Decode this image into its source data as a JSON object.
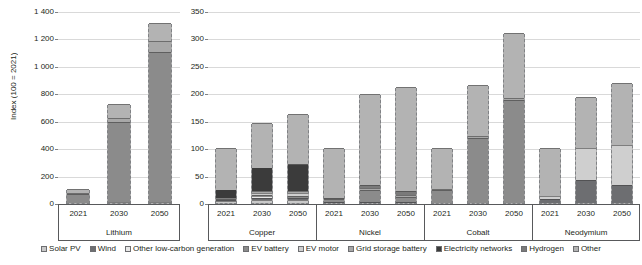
{
  "chart_data": {
    "type": "bar",
    "subtype": "stacked-bar",
    "title": "",
    "ylabel": "Index (100 = 2021)",
    "xlabel": "",
    "grid": true,
    "legend_position": "bottom",
    "panels": [
      {
        "name": "left-panel",
        "ylim": [
          0,
          1400
        ],
        "yticks": [
          0,
          200,
          400,
          600,
          800,
          1000,
          1200,
          1400
        ],
        "ytick_labels": [
          "0",
          "200",
          "400",
          "600",
          "800",
          "1 000",
          "1 200",
          "1 400"
        ],
        "groups": [
          {
            "group": "Lithium",
            "categories": [
              "2021",
              "2030",
              "2050"
            ],
            "series": [
              {
                "name": "Solar PV",
                "values": [
                  2,
                  4,
                  5
                ]
              },
              {
                "name": "Wind",
                "values": [
                  1,
                  2,
                  3
                ]
              },
              {
                "name": "Other low-carbon generation",
                "values": [
                  0,
                  0,
                  0
                ]
              },
              {
                "name": "EV battery",
                "values": [
                  62,
                  588,
                  1090
                ]
              },
              {
                "name": "EV motor",
                "values": [
                  0,
                  0,
                  0
                ]
              },
              {
                "name": "Grid storage battery",
                "values": [
                  5,
                  25,
                  85
                ]
              },
              {
                "name": "Electricity networks",
                "values": [
                  0,
                  0,
                  0
                ]
              },
              {
                "name": "Hydrogen",
                "values": [
                  0,
                  0,
                  0
                ]
              },
              {
                "name": "Other",
                "values": [
                  30,
                  101,
                  127
                ]
              }
            ],
            "totals": [
              100,
              720,
              1310
            ]
          }
        ]
      },
      {
        "name": "right-panel",
        "ylim": [
          0,
          350
        ],
        "yticks": [
          0,
          50,
          100,
          150,
          200,
          250,
          300,
          350
        ],
        "ytick_labels": [
          "0",
          "50",
          "100",
          "150",
          "200",
          "250",
          "300",
          "350"
        ],
        "groups": [
          {
            "group": "Copper",
            "categories": [
              "2021",
              "2030",
              "2050"
            ],
            "series": [
              {
                "name": "Solar PV",
                "values": [
                  3,
                  6,
                  5
                ]
              },
              {
                "name": "Wind",
                "values": [
                  2,
                  4,
                  4
                ]
              },
              {
                "name": "Other low-carbon generation",
                "values": [
                  1,
                  2,
                  2
                ]
              },
              {
                "name": "EV battery",
                "values": [
                  1,
                  2,
                  2
                ]
              },
              {
                "name": "EV motor",
                "values": [
                  2,
                  5,
                  6
                ]
              },
              {
                "name": "Grid storage battery",
                "values": [
                  1,
                  2,
                  3
                ]
              },
              {
                "name": "Electricity networks",
                "values": [
                  13,
                  42,
                  48
                ]
              },
              {
                "name": "Hydrogen",
                "values": [
                  0,
                  1,
                  1
                ]
              },
              {
                "name": "Other",
                "values": [
                  77,
                  81,
                  91
                ]
              }
            ],
            "totals": [
              100,
              145,
              162
            ]
          },
          {
            "group": "Nickel",
            "categories": [
              "2021",
              "2030",
              "2050"
            ],
            "series": [
              {
                "name": "Solar PV",
                "values": [
                  0,
                  0,
                  0
                ]
              },
              {
                "name": "Wind",
                "values": [
                  1,
                  2,
                  2
                ]
              },
              {
                "name": "Other low-carbon generation",
                "values": [
                  1,
                  2,
                  2
                ]
              },
              {
                "name": "EV battery",
                "values": [
                  5,
                  19,
                  7
                ]
              },
              {
                "name": "EV motor",
                "values": [
                  0,
                  0,
                  0
                ]
              },
              {
                "name": "Grid storage battery",
                "values": [
                  1,
                  5,
                  4
                ]
              },
              {
                "name": "Electricity networks",
                "values": [
                  0,
                  0,
                  0
                ]
              },
              {
                "name": "Hydrogen",
                "values": [
                  1,
                  4,
                  6
                ]
              },
              {
                "name": "Other",
                "values": [
                  91,
                  166,
                  191
                ]
              }
            ],
            "totals": [
              100,
              198,
              212
            ]
          },
          {
            "group": "Cobalt",
            "categories": [
              "2021",
              "2030",
              "2050"
            ],
            "series": [
              {
                "name": "Solar PV",
                "values": [
                  0,
                  0,
                  0
                ]
              },
              {
                "name": "Wind",
                "values": [
                  0,
                  0,
                  0
                ]
              },
              {
                "name": "Other low-carbon generation",
                "values": [
                  0,
                  0,
                  0
                ]
              },
              {
                "name": "EV battery",
                "values": [
                  24,
                  118,
                  187
                ]
              },
              {
                "name": "EV motor",
                "values": [
                  0,
                  0,
                  0
                ]
              },
              {
                "name": "Grid storage battery",
                "values": [
                  2,
                  4,
                  5
                ]
              },
              {
                "name": "Electricity networks",
                "values": [
                  0,
                  0,
                  0
                ]
              },
              {
                "name": "Hydrogen",
                "values": [
                  0,
                  0,
                  0
                ]
              },
              {
                "name": "Other",
                "values": [
                  74,
                  93,
                  118
                ]
              }
            ],
            "totals": [
              100,
              215,
              310
            ]
          },
          {
            "group": "Neodymium",
            "categories": [
              "2021",
              "2030",
              "2050"
            ],
            "series": [
              {
                "name": "Solar PV",
                "values": [
                  0,
                  0,
                  0
                ]
              },
              {
                "name": "Wind",
                "values": [
                  8,
                  42,
                  33
                ]
              },
              {
                "name": "Other low-carbon generation",
                "values": [
                  0,
                  0,
                  0
                ]
              },
              {
                "name": "EV battery",
                "values": [
                  0,
                  0,
                  0
                ]
              },
              {
                "name": "EV motor",
                "values": [
                  4,
                  58,
                  73
                ]
              },
              {
                "name": "Grid storage battery",
                "values": [
                  0,
                  0,
                  0
                ]
              },
              {
                "name": "Electricity networks",
                "values": [
                  0,
                  0,
                  0
                ]
              },
              {
                "name": "Hydrogen",
                "values": [
                  0,
                  0,
                  0
                ]
              },
              {
                "name": "Other",
                "values": [
                  88,
                  93,
                  113
                ]
              }
            ],
            "totals": [
              100,
              193,
              219
            ]
          }
        ]
      }
    ],
    "legend": [
      {
        "label": "Solar PV",
        "color": "#c9c9c9"
      },
      {
        "label": "Wind",
        "color": "#6d6e71"
      },
      {
        "label": "Other low-carbon generation",
        "color": "#e8e8e8"
      },
      {
        "label": "EV battery",
        "color": "#8b8b8b"
      },
      {
        "label": "EV motor",
        "color": "#cfcfcf"
      },
      {
        "label": "Grid storage battery",
        "color": "#a8a8a8"
      },
      {
        "label": "Electricity networks",
        "color": "#3b3b3b"
      },
      {
        "label": "Hydrogen",
        "color": "#7a7a7a"
      },
      {
        "label": "Other",
        "color": "#b3b3b3"
      }
    ],
    "series_colors": {
      "Solar PV": "#c9c9c9",
      "Wind": "#6d6e71",
      "Other low-carbon generation": "#e8e8e8",
      "EV battery": "#8b8b8b",
      "EV motor": "#cfcfcf",
      "Grid storage battery": "#a8a8a8",
      "Electricity networks": "#3b3b3b",
      "Hydrogen": "#7a7a7a",
      "Other": "#b3b3b3"
    }
  }
}
